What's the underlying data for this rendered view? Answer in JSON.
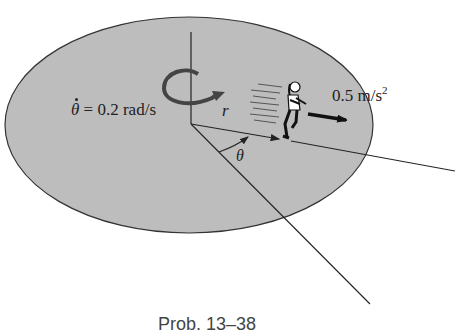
{
  "figure": {
    "angular_velocity": {
      "symbol": "θ",
      "equals": " = ",
      "value": "0.2 rad/s"
    },
    "radius_label": "r",
    "angle_label": "θ",
    "acceleration": {
      "value": "0.5 m/s",
      "exponent": "2"
    },
    "caption": "Prob. 13–38",
    "colors": {
      "platform_fill": "#bdbdbd",
      "line": "#222222",
      "background": "#ffffff"
    }
  }
}
